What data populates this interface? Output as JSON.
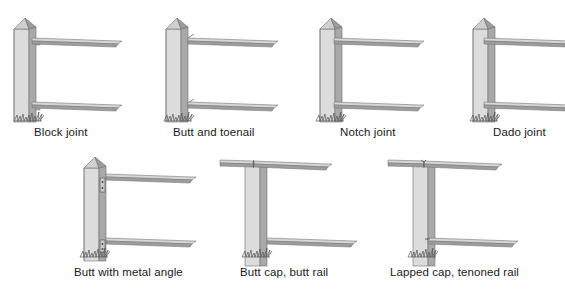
{
  "figure": {
    "type": "fence rail joint types illustration",
    "colors": {
      "post_front": "#d9d9d9",
      "post_side": "#a8a8a8",
      "post_outline": "#6e6e6e",
      "rail_top": "#d4d4d4",
      "rail_face": "#9a9a9a",
      "grass": "#555555",
      "label_text": "#1a1a1a"
    },
    "panels": [
      {
        "id": "block-joint",
        "label": "Block joint",
        "cap": "pyramid",
        "joint": "block"
      },
      {
        "id": "butt-and-toenail",
        "label": "Butt and toenail",
        "cap": "pyramid",
        "joint": "toenail"
      },
      {
        "id": "notch-joint",
        "label": "Notch joint",
        "cap": "pyramid",
        "joint": "notch"
      },
      {
        "id": "dado-joint",
        "label": "Dado joint",
        "cap": "pyramid",
        "joint": "dado"
      },
      {
        "id": "butt-with-metal-angle",
        "label": "Butt with metal angle",
        "cap": "pyramid",
        "joint": "metal-angle"
      },
      {
        "id": "butt-cap-butt-rail",
        "label": "Butt cap, butt rail",
        "cap": "butt-cap",
        "joint": "butt"
      },
      {
        "id": "lapped-cap-tenoned-rail",
        "label": "Lapped cap, tenoned rail",
        "cap": "lapped-cap",
        "joint": "tenon"
      }
    ]
  }
}
